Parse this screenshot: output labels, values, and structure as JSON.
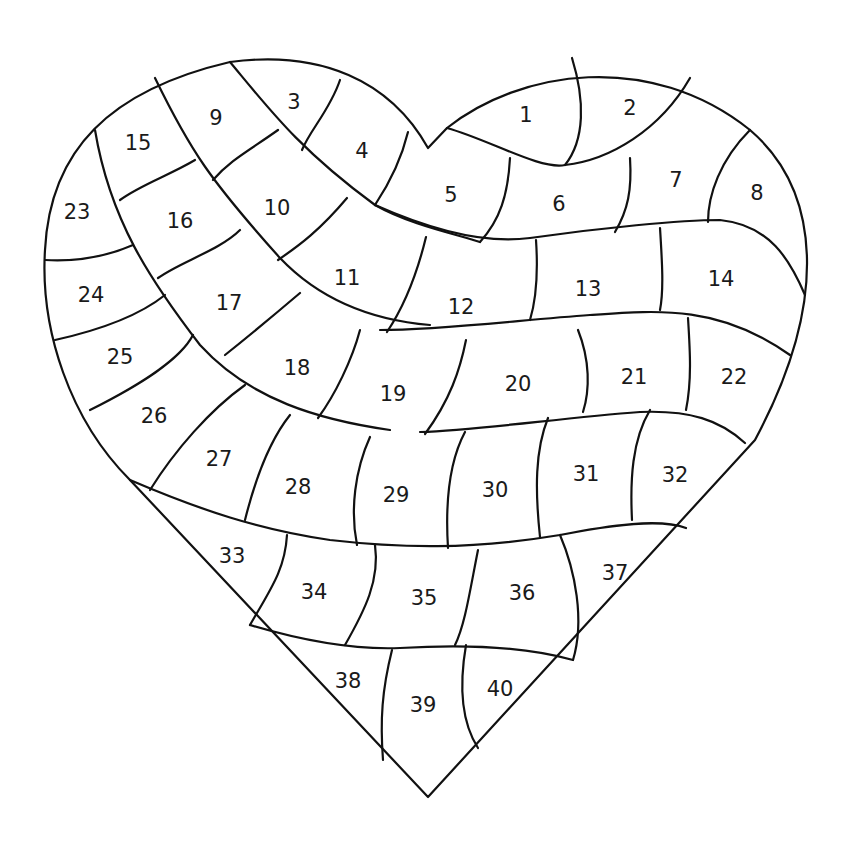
{
  "diagram": {
    "colors": {
      "line": "#111111",
      "text": "#1a1a1a",
      "background": "#ffffff"
    },
    "cells": [
      {
        "n": "1",
        "x": 526,
        "y": 115
      },
      {
        "n": "2",
        "x": 630,
        "y": 108
      },
      {
        "n": "3",
        "x": 294,
        "y": 102
      },
      {
        "n": "4",
        "x": 362,
        "y": 151
      },
      {
        "n": "5",
        "x": 451,
        "y": 195
      },
      {
        "n": "6",
        "x": 559,
        "y": 204
      },
      {
        "n": "7",
        "x": 676,
        "y": 180
      },
      {
        "n": "8",
        "x": 757,
        "y": 193
      },
      {
        "n": "9",
        "x": 216,
        "y": 118
      },
      {
        "n": "10",
        "x": 277,
        "y": 208
      },
      {
        "n": "11",
        "x": 347,
        "y": 278
      },
      {
        "n": "12",
        "x": 461,
        "y": 307
      },
      {
        "n": "13",
        "x": 588,
        "y": 289
      },
      {
        "n": "14",
        "x": 721,
        "y": 279
      },
      {
        "n": "15",
        "x": 138,
        "y": 143
      },
      {
        "n": "16",
        "x": 180,
        "y": 221
      },
      {
        "n": "17",
        "x": 229,
        "y": 303
      },
      {
        "n": "18",
        "x": 297,
        "y": 368
      },
      {
        "n": "19",
        "x": 393,
        "y": 394
      },
      {
        "n": "20",
        "x": 518,
        "y": 384
      },
      {
        "n": "21",
        "x": 634,
        "y": 377
      },
      {
        "n": "22",
        "x": 734,
        "y": 377
      },
      {
        "n": "23",
        "x": 77,
        "y": 212
      },
      {
        "n": "24",
        "x": 91,
        "y": 295
      },
      {
        "n": "25",
        "x": 120,
        "y": 357
      },
      {
        "n": "26",
        "x": 154,
        "y": 416
      },
      {
        "n": "27",
        "x": 219,
        "y": 459
      },
      {
        "n": "28",
        "x": 298,
        "y": 487
      },
      {
        "n": "29",
        "x": 396,
        "y": 495
      },
      {
        "n": "30",
        "x": 495,
        "y": 490
      },
      {
        "n": "31",
        "x": 586,
        "y": 474
      },
      {
        "n": "32",
        "x": 675,
        "y": 475
      },
      {
        "n": "33",
        "x": 232,
        "y": 556
      },
      {
        "n": "34",
        "x": 314,
        "y": 592
      },
      {
        "n": "35",
        "x": 424,
        "y": 598
      },
      {
        "n": "36",
        "x": 522,
        "y": 593
      },
      {
        "n": "37",
        "x": 615,
        "y": 573
      },
      {
        "n": "38",
        "x": 348,
        "y": 681
      },
      {
        "n": "39",
        "x": 423,
        "y": 705
      },
      {
        "n": "40",
        "x": 500,
        "y": 689
      }
    ]
  }
}
